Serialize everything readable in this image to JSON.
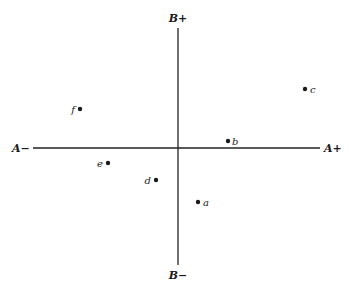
{
  "axes": {
    "a_minus": "A−",
    "a_plus": "A+",
    "b_plus": "B+",
    "b_minus": "B−"
  },
  "chart_data": {
    "type": "scatter",
    "title": "",
    "xlabel": "A",
    "ylabel": "B",
    "x_ends": [
      "A−",
      "A+"
    ],
    "y_ends": [
      "B−",
      "B+"
    ],
    "grid": false,
    "points": [
      {
        "label": "a",
        "x": 0.2,
        "y": -0.46
      },
      {
        "label": "b",
        "x": 0.5,
        "y": 0.06
      },
      {
        "label": "c",
        "x": 1.0,
        "y": 0.5
      },
      {
        "label": "d",
        "x": -0.2,
        "y": -0.27
      },
      {
        "label": "e",
        "x": -0.6,
        "y": -0.12
      },
      {
        "label": "f",
        "x": -0.8,
        "y": 0.33
      }
    ]
  },
  "points_px": [
    {
      "label": "a",
      "cx": 198,
      "cy": 202,
      "tx": 203,
      "ty": 206,
      "anchor": "start"
    },
    {
      "label": "b",
      "cx": 228,
      "cy": 141,
      "tx": 232,
      "ty": 145,
      "anchor": "start"
    },
    {
      "label": "c",
      "cx": 305,
      "cy": 89,
      "tx": 310,
      "ty": 93,
      "anchor": "start"
    },
    {
      "label": "d",
      "cx": 156,
      "cy": 180,
      "tx": 151,
      "ty": 184,
      "anchor": "end"
    },
    {
      "label": "e",
      "cx": 108,
      "cy": 163,
      "tx": 103,
      "ty": 167,
      "anchor": "end"
    },
    {
      "label": "f",
      "cx": 80,
      "cy": 109,
      "tx": 75,
      "ty": 113,
      "anchor": "end"
    }
  ]
}
